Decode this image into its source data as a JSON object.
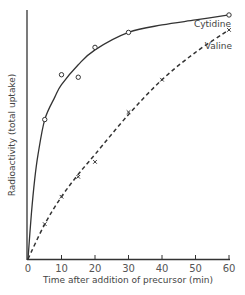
{
  "chart_data": {
    "type": "line",
    "title": "",
    "xlabel": "Time after addition of precursor (min)",
    "ylabel": "Radioactivity (total uptake)",
    "xlim": [
      0,
      60
    ],
    "ylim": [
      0,
      100
    ],
    "x_ticks": [
      "0",
      "10",
      "20",
      "30",
      "40",
      "50",
      "60"
    ],
    "y_ticks": [],
    "grid": false,
    "legend": "inline labels at curve ends",
    "series": [
      {
        "name": "Cytidine",
        "style": "solid",
        "marker": "circle",
        "points": [
          [
            5,
            56
          ],
          [
            10,
            74
          ],
          [
            15,
            73
          ],
          [
            20,
            85
          ],
          [
            30,
            91
          ],
          [
            60,
            98
          ]
        ],
        "curve": [
          [
            0,
            0
          ],
          [
            1,
            18
          ],
          [
            2,
            32
          ],
          [
            3,
            42
          ],
          [
            5,
            56
          ],
          [
            8,
            65
          ],
          [
            10,
            70
          ],
          [
            15,
            78
          ],
          [
            20,
            84
          ],
          [
            30,
            91
          ],
          [
            40,
            94
          ],
          [
            50,
            96
          ],
          [
            60,
            98
          ]
        ]
      },
      {
        "name": "Valine",
        "style": "dashed",
        "marker": "x",
        "points": [
          [
            5,
            14
          ],
          [
            10,
            25
          ],
          [
            15,
            33
          ],
          [
            20,
            39
          ],
          [
            30,
            59
          ],
          [
            40,
            72
          ],
          [
            60,
            92
          ]
        ],
        "curve": [
          [
            0,
            0
          ],
          [
            5,
            14
          ],
          [
            10,
            25
          ],
          [
            15,
            34
          ],
          [
            20,
            42
          ],
          [
            30,
            58
          ],
          [
            40,
            72
          ],
          [
            50,
            83
          ],
          [
            60,
            92
          ]
        ]
      }
    ]
  }
}
